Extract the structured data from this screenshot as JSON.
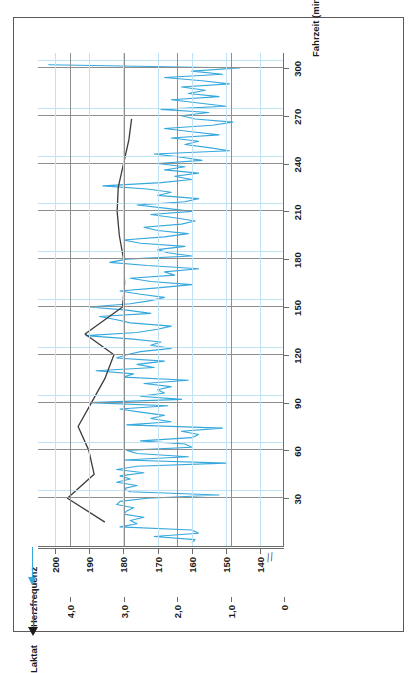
{
  "figure": {
    "axis_titles": {
      "lactate": "Laktat",
      "heart_rate": "Herzfrequenz",
      "x": "Fahrzeit (min)"
    },
    "colors": {
      "lactate_line": "#3c3c3c",
      "heart_rate_line": "#35a8dd",
      "grid_dark": "#8e8e8e",
      "grid_blue": "#bfe2f5",
      "frame": "#5a5a5a"
    },
    "axis_break_symbol": "//",
    "orientation_note": "rotated"
  },
  "chart_data": {
    "type": "line",
    "title": "",
    "xlabel": "Fahrzeit (min)",
    "ylabel": "Laktat",
    "y2label": "Herzfrequenz",
    "xlim": [
      0,
      310
    ],
    "xticks": [
      30,
      60,
      90,
      120,
      150,
      180,
      210,
      240,
      270,
      300
    ],
    "xticklabels": [
      "30",
      "60",
      "90",
      "120",
      "150",
      "180",
      "210",
      "240",
      "270",
      "300"
    ],
    "ylim": [
      0,
      4.6
    ],
    "yticks": [
      0,
      1.0,
      2.0,
      3.0,
      4.0
    ],
    "yticklabels": [
      "0",
      "1,0",
      "2,0",
      "3,0",
      "4,0"
    ],
    "y2lim": [
      133,
      205
    ],
    "y2ticks": [
      140,
      150,
      160,
      170,
      180,
      190,
      200
    ],
    "y2ticklabels": [
      "140",
      "150",
      "160",
      "170",
      "180",
      "190",
      "200"
    ],
    "grid": true,
    "legend": "none",
    "series": [
      {
        "name": "Laktat",
        "axis": "left",
        "color": "#3c3c3c",
        "x": [
          15,
          30,
          45,
          60,
          75,
          90,
          105,
          120,
          133,
          150,
          165,
          180,
          195,
          210,
          225,
          240,
          255,
          268,
          268
        ],
        "values": [
          3.35,
          4.05,
          3.55,
          3.65,
          3.85,
          3.6,
          3.35,
          3.18,
          3.72,
          3.02,
          2.98,
          3.0,
          3.08,
          3.12,
          3.1,
          3.0,
          2.9,
          2.85,
          2.85
        ]
      },
      {
        "name": "Herzfrequenz",
        "axis": "right",
        "color": "#35a8dd",
        "x": [
          2,
          4,
          6,
          8,
          10,
          12,
          14,
          16,
          18,
          20,
          22,
          24,
          26,
          28,
          30,
          32,
          34,
          36,
          38,
          40,
          42,
          44,
          46,
          48,
          50,
          52,
          54,
          56,
          58,
          60,
          62,
          64,
          66,
          68,
          70,
          72,
          74,
          76,
          78,
          80,
          82,
          84,
          86,
          88,
          90,
          92,
          94,
          96,
          98,
          100,
          102,
          104,
          106,
          108,
          110,
          112,
          114,
          116,
          118,
          120,
          122,
          124,
          126,
          128,
          130,
          132,
          134,
          136,
          138,
          140,
          142,
          144,
          146,
          148,
          150,
          152,
          154,
          156,
          158,
          160,
          162,
          164,
          166,
          168,
          170,
          172,
          174,
          176,
          178,
          180,
          182,
          184,
          186,
          188,
          190,
          192,
          194,
          196,
          198,
          200,
          202,
          204,
          206,
          208,
          210,
          212,
          214,
          216,
          218,
          220,
          222,
          224,
          226,
          228,
          230,
          232,
          234,
          236,
          238,
          240,
          242,
          244,
          246,
          248,
          250,
          252,
          254,
          256,
          258,
          260,
          262,
          264,
          266,
          268,
          270,
          272,
          274,
          276,
          278,
          280,
          282,
          284,
          286,
          288,
          290,
          292,
          294,
          296,
          298,
          300,
          302
        ],
        "values": [
          160,
          159,
          171,
          158,
          160,
          181,
          176,
          178,
          174,
          180,
          179,
          177,
          182,
          181,
          173,
          152,
          178,
          180,
          176,
          182,
          178,
          181,
          174,
          182,
          176,
          150,
          180,
          161,
          176,
          179,
          160,
          162,
          175,
          160,
          158,
          163,
          151,
          179,
          166,
          172,
          168,
          175,
          181,
          167,
          190,
          163,
          175,
          168,
          170,
          166,
          174,
          161,
          180,
          177,
          188,
          171,
          176,
          168,
          182,
          179,
          175,
          166,
          172,
          169,
          178,
          191,
          176,
          170,
          166,
          178,
          182,
          187,
          172,
          179,
          190,
          178,
          172,
          168,
          175,
          181,
          170,
          160,
          172,
          178,
          165,
          168,
          158,
          173,
          184,
          179,
          160,
          167,
          170,
          162,
          175,
          180,
          168,
          161,
          170,
          174,
          163,
          159,
          165,
          172,
          160,
          168,
          176,
          162,
          158,
          170,
          166,
          173,
          186,
          169,
          160,
          165,
          158,
          168,
          162,
          170,
          157,
          163,
          171,
          149,
          155,
          162,
          158,
          166,
          152,
          160,
          168,
          154,
          148,
          159,
          163,
          155,
          169,
          150,
          158,
          166,
          152,
          161,
          156,
          163,
          149,
          157,
          168,
          151,
          160,
          146,
          202
        ]
      }
    ]
  }
}
